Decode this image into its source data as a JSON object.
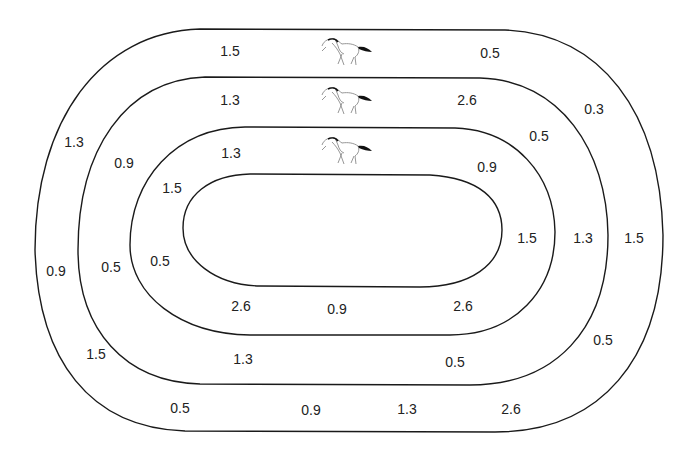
{
  "diagram": {
    "type": "racetrack",
    "lanes": 3,
    "labels": [
      {
        "id": "lane1-top-left",
        "lane": 1,
        "value": "1.5",
        "x": 230,
        "y": 51
      },
      {
        "id": "lane1-top-right",
        "lane": 1,
        "value": "0.5",
        "x": 490,
        "y": 53
      },
      {
        "id": "lane1-upper-right-curve",
        "lane": 1,
        "value": "0.3",
        "x": 594,
        "y": 109
      },
      {
        "id": "lane1-right",
        "lane": 1,
        "value": "1.5",
        "x": 634,
        "y": 238
      },
      {
        "id": "lane1-lower-right-curve",
        "lane": 1,
        "value": "0.5",
        "x": 603,
        "y": 340
      },
      {
        "id": "lane1-bottom-right",
        "lane": 1,
        "value": "2.6",
        "x": 511,
        "y": 409
      },
      {
        "id": "lane1-bottom-mid-right",
        "lane": 1,
        "value": "1.3",
        "x": 407,
        "y": 409
      },
      {
        "id": "lane1-bottom-mid-left",
        "lane": 1,
        "value": "0.9",
        "x": 311,
        "y": 410
      },
      {
        "id": "lane1-bottom-left",
        "lane": 1,
        "value": "0.5",
        "x": 180,
        "y": 408
      },
      {
        "id": "lane1-lower-left-curve",
        "lane": 1,
        "value": "1.5",
        "x": 96,
        "y": 354
      },
      {
        "id": "lane1-left",
        "lane": 1,
        "value": "0.9",
        "x": 56,
        "y": 271
      },
      {
        "id": "lane1-upper-left-curve",
        "lane": 1,
        "value": "1.3",
        "x": 74,
        "y": 142
      },
      {
        "id": "lane2-top-left",
        "lane": 2,
        "value": "1.3",
        "x": 230,
        "y": 100
      },
      {
        "id": "lane2-top-right",
        "lane": 2,
        "value": "2.6",
        "x": 467,
        "y": 100
      },
      {
        "id": "lane2-upper-right-curve",
        "lane": 2,
        "value": "0.5",
        "x": 539,
        "y": 136
      },
      {
        "id": "lane2-right",
        "lane": 2,
        "value": "1.3",
        "x": 583,
        "y": 238
      },
      {
        "id": "lane2-lower-right-curve",
        "lane": 2,
        "value": "0.5",
        "x": 455,
        "y": 362
      },
      {
        "id": "lane2-bottom-left",
        "lane": 2,
        "value": "1.3",
        "x": 243,
        "y": 359
      },
      {
        "id": "lane2-left",
        "lane": 2,
        "value": "0.5",
        "x": 111,
        "y": 267
      },
      {
        "id": "lane2-upper-left-curve",
        "lane": 2,
        "value": "0.9",
        "x": 124,
        "y": 163
      },
      {
        "id": "lane3-top-left",
        "lane": 3,
        "value": "1.3",
        "x": 231,
        "y": 153
      },
      {
        "id": "lane3-upper-right-curve",
        "lane": 3,
        "value": "0.9",
        "x": 487,
        "y": 167
      },
      {
        "id": "lane3-right",
        "lane": 3,
        "value": "1.5",
        "x": 527,
        "y": 238
      },
      {
        "id": "lane3-bottom-right",
        "lane": 3,
        "value": "2.6",
        "x": 463,
        "y": 306
      },
      {
        "id": "lane3-bottom-mid",
        "lane": 3,
        "value": "0.9",
        "x": 337,
        "y": 309
      },
      {
        "id": "lane3-bottom-left",
        "lane": 3,
        "value": "2.6",
        "x": 241,
        "y": 306
      },
      {
        "id": "lane3-left",
        "lane": 3,
        "value": "0.5",
        "x": 160,
        "y": 261
      },
      {
        "id": "lane3-upper-left-curve",
        "lane": 3,
        "value": "1.5",
        "x": 172,
        "y": 188
      }
    ],
    "horses": [
      {
        "lane": 1,
        "icon": "horse-icon",
        "x": 347,
        "y": 52
      },
      {
        "lane": 2,
        "icon": "horse-icon",
        "x": 347,
        "y": 101
      },
      {
        "lane": 3,
        "icon": "horse-icon",
        "x": 347,
        "y": 151
      }
    ],
    "colors": {
      "line": "#1a1a1a",
      "text": "#222222",
      "background": "#ffffff",
      "horse_outline": "#888888",
      "horse_tail": "#111111"
    }
  }
}
